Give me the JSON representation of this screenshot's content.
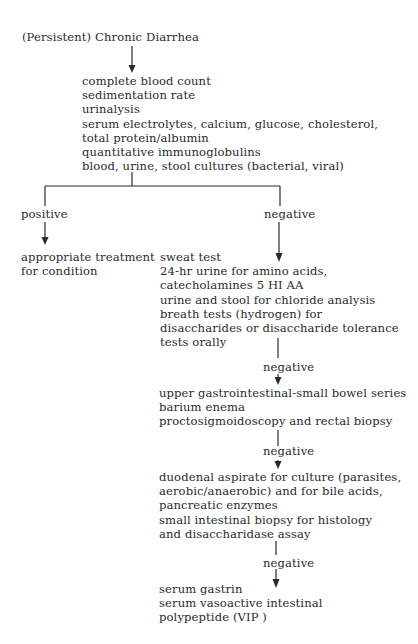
{
  "title": "(Persistent) Chronic Diarrhea",
  "initial_tests": [
    "complete blood count",
    "sedimentation rate",
    "urinalysis",
    "serum electrolytes, calcium, glucose, cholesterol,",
    "total protein/albumin",
    "quantitative immunoglobulins",
    "blood, urine, stool cultures (bacterial, viral)"
  ],
  "branches": {
    "positive_label": "positive",
    "negative_label": "negative"
  },
  "positive_outcome": [
    "appropriate treatment",
    "for condition"
  ],
  "step2_tests": [
    "sweat test",
    "24-hr urine for amino acids,",
    "catecholamines  5 HI AA",
    "urine and stool for chloride analysis",
    "breath tests (hydrogen) for",
    "disaccharides or disaccharide tolerance",
    "tests orally"
  ],
  "step2_result": "negative",
  "step3_tests": [
    "upper gastrointestinal-small bowel series",
    "barium enema",
    "proctosigmoidoscopy and rectal biopsy"
  ],
  "step3_result": "negative",
  "step4_tests": [
    "duodenal aspirate for culture (parasites,",
    "aerobic/anaerobic) and for bile acids,",
    "pancreatic enzymes",
    "small intestinal biopsy for histology",
    "and disaccharidase assay"
  ],
  "step4_result": "negative",
  "step5_tests": [
    "serum gastrin",
    "serum vasoactive intestinal",
    "polypeptide (VIP )"
  ]
}
